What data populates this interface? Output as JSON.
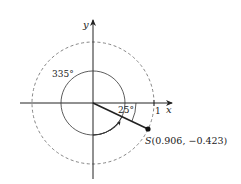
{
  "diagram": {
    "axes": {
      "x_label": "x",
      "y_label": "y"
    },
    "tick_label": "1",
    "angles": {
      "negative_angle": "25°",
      "positive_angle": "335°"
    },
    "point": {
      "name": "S",
      "coords": "(0.906, −0.423)",
      "x": 0.906,
      "y": -0.423
    },
    "colors": {
      "stroke": "#222222",
      "dashed": "#777777"
    }
  }
}
